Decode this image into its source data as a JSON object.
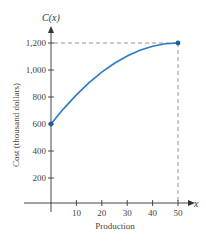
{
  "chart_data": {
    "type": "line",
    "title": "",
    "function_label": "C(x)",
    "x_var": "x",
    "xlabel": "Production",
    "ylabel": "Cost (thousand dollars)",
    "x_ticks": [
      10,
      20,
      30,
      40,
      50
    ],
    "y_ticks": [
      200,
      400,
      600,
      800,
      1000,
      1200
    ],
    "x_tick_labels": [
      "10",
      "20",
      "30",
      "40",
      "50"
    ],
    "y_tick_labels": [
      "200",
      "400",
      "600",
      "800",
      "1,000",
      "1,200"
    ],
    "xlim": [
      0,
      52
    ],
    "ylim": [
      0,
      1300
    ],
    "grid": false,
    "series": [
      {
        "name": "C(x)",
        "color": "#2f7ac2",
        "x": [
          0,
          5,
          10,
          15,
          20,
          25,
          30,
          35,
          40,
          45,
          50
        ],
        "y": [
          600,
          714,
          816,
          906,
          984,
          1050,
          1104,
          1146,
          1176,
          1194,
          1200
        ]
      }
    ],
    "endpoints": [
      {
        "x": 0,
        "y": 600
      },
      {
        "x": 50,
        "y": 1200
      }
    ],
    "reference_lines": [
      {
        "type": "horizontal",
        "y": 1200,
        "from_x": 0,
        "to_x": 50,
        "style": "dashed"
      },
      {
        "type": "vertical",
        "x": 50,
        "from_y": 0,
        "to_y": 1200,
        "style": "dashed"
      }
    ]
  },
  "colors": {
    "curve": "#2f7ac2",
    "axis": "#333333",
    "dashed": "#888888"
  }
}
